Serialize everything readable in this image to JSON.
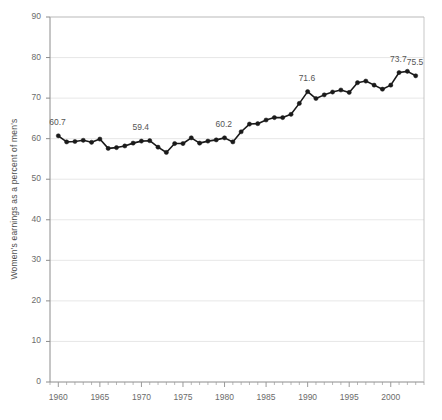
{
  "chart_data": {
    "type": "line",
    "title": "",
    "subtitle": "",
    "xlabel": "",
    "ylabel": "Women's earnings as a percent of men's",
    "xlim": [
      1959,
      2004
    ],
    "ylim": [
      0,
      90
    ],
    "grid": true,
    "legend": null,
    "y_ticks": [
      0,
      10,
      20,
      30,
      40,
      50,
      60,
      70,
      80,
      90
    ],
    "y_tick_labels": [
      "0",
      "10",
      "20",
      "30",
      "40",
      "50",
      "60",
      "70",
      "80",
      "90"
    ],
    "x_ticks": [
      1960,
      1965,
      1970,
      1975,
      1980,
      1985,
      1990,
      1995,
      2000
    ],
    "x_tick_labels": [
      "1960",
      "1965",
      "1970",
      "1975",
      "1980",
      "1985",
      "1990",
      "1995",
      "2000"
    ],
    "x_minor_tick_step": 1,
    "series": [
      {
        "name": "Women's earnings as a percent of men's",
        "color": "#1a1a1a",
        "marker": "circle",
        "x": [
          1960,
          1961,
          1962,
          1963,
          1964,
          1965,
          1966,
          1967,
          1968,
          1969,
          1970,
          1971,
          1972,
          1973,
          1974,
          1975,
          1976,
          1977,
          1978,
          1979,
          1980,
          1981,
          1982,
          1983,
          1984,
          1985,
          1986,
          1987,
          1988,
          1989,
          1990,
          1991,
          1992,
          1993,
          1994,
          1995,
          1996,
          1997,
          1998,
          1999,
          2000,
          2001,
          2002,
          2003
        ],
        "values": [
          60.7,
          59.2,
          59.3,
          59.6,
          59.1,
          59.9,
          57.6,
          57.8,
          58.2,
          58.9,
          59.4,
          59.5,
          57.9,
          56.6,
          58.8,
          58.8,
          60.2,
          58.9,
          59.4,
          59.7,
          60.2,
          59.2,
          61.7,
          63.6,
          63.7,
          64.6,
          65.2,
          65.2,
          66.0,
          68.7,
          71.6,
          69.9,
          70.8,
          71.5,
          72.0,
          71.4,
          73.8,
          74.2,
          73.2,
          72.2,
          73.2,
          76.3,
          76.6,
          75.5
        ]
      }
    ],
    "annotations": [
      {
        "label": "60.7",
        "x": 1960,
        "y": 60.7,
        "position": "above"
      },
      {
        "label": "59.4",
        "x": 1970,
        "y": 59.4,
        "position": "above"
      },
      {
        "label": "60.2",
        "x": 1980,
        "y": 60.2,
        "position": "above"
      },
      {
        "label": "71.6",
        "x": 1990,
        "y": 71.6,
        "position": "above"
      },
      {
        "label": "73.7",
        "x": 2001,
        "y": 76.3,
        "position": "above"
      },
      {
        "label": "75.5",
        "x": 2003,
        "y": 75.5,
        "position": "above"
      }
    ]
  },
  "axis": {
    "y_title": "Women's earnings as a percent of men's"
  }
}
